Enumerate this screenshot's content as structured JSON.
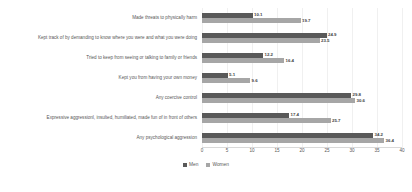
{
  "chart_data": {
    "type": "bar",
    "orientation": "horizontal",
    "title": "",
    "xlabel": "",
    "ylabel": "",
    "xlim": [
      0,
      40
    ],
    "grid": true,
    "legend_position": "bottom",
    "ticks": [
      "0",
      "5",
      "10",
      "15",
      "20",
      "25",
      "30",
      "35",
      "40"
    ],
    "tick_values": [
      0,
      5,
      10,
      15,
      20,
      25,
      30,
      35,
      40
    ],
    "categories": [
      "Made threats to physically harm",
      "Kept track of by demanding to know where you were and what you were doing",
      "Tried to keep from seeing or talking to family or friends",
      "Kept you from having your own money",
      "Any coercive control",
      "Expressive aggressionl, insulted, humiliated, made fun of in front of others",
      "Any psychological aggression"
    ],
    "series": [
      {
        "name": "Men",
        "color": "#595959",
        "values": [
          10.1,
          24.9,
          12.2,
          5.1,
          29.8,
          17.4,
          34.2
        ],
        "labels": [
          "10.1",
          "24.9",
          "12.2",
          "5.1",
          "29.8",
          "17.4",
          "34.2"
        ]
      },
      {
        "name": "Women",
        "color": "#a6a6a6",
        "values": [
          19.7,
          23.5,
          16.4,
          9.6,
          30.6,
          25.7,
          36.4
        ],
        "labels": [
          "19.7",
          "23.5",
          "16.4",
          "9.6",
          "30.6",
          "25.7",
          "36.4"
        ]
      }
    ]
  }
}
